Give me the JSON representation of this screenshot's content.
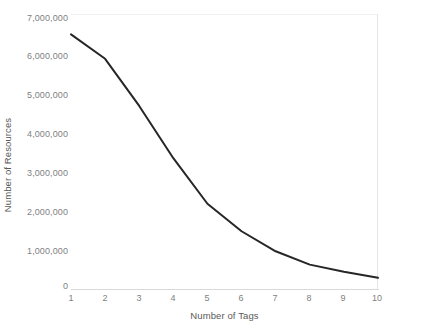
{
  "chart_data": {
    "type": "line",
    "title": "",
    "xlabel": "Number of Tags",
    "ylabel": "Number of Resources",
    "x": [
      1,
      2,
      3,
      4,
      5,
      6,
      7,
      8,
      9,
      10
    ],
    "categories": [
      "1",
      "2",
      "3",
      "4",
      "5",
      "6",
      "7",
      "8",
      "9",
      "10"
    ],
    "values": [
      6480000,
      5860000,
      4660000,
      3330000,
      2170000,
      1470000,
      960000,
      620000,
      440000,
      285000
    ],
    "series": [
      {
        "name": "Number of Resources",
        "values": [
          6480000,
          5860000,
          4660000,
          3330000,
          2170000,
          1470000,
          960000,
          620000,
          440000,
          285000
        ]
      }
    ],
    "xlim": [
      1,
      10
    ],
    "ylim": [
      0,
      7000000
    ],
    "ytick_labels": [
      "7,000,000",
      "6,000,000",
      "5,000,000",
      "4,000,000",
      "3,000,000",
      "2,000,000",
      "1,000,000",
      "0"
    ],
    "ytick_values": [
      7000000,
      6000000,
      5000000,
      4000000,
      3000000,
      2000000,
      1000000,
      0
    ],
    "xtick_labels": [
      "1",
      "2",
      "3",
      "4",
      "5",
      "6",
      "7",
      "8",
      "9",
      "10"
    ],
    "grid": false,
    "legend": "none",
    "line_color": "#262626",
    "line_width": 2,
    "axis_color": "#d9d9d9",
    "text_color": "#7f7f7f"
  }
}
